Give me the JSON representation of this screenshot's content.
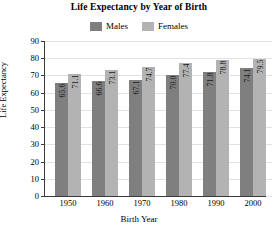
{
  "chart_data": {
    "type": "bar",
    "title": "Life Expectancy by Year of Birth",
    "xlabel": "Birth Year",
    "ylabel": "Life Expectancy",
    "categories": [
      "1950",
      "1960",
      "1970",
      "1980",
      "1990",
      "2000"
    ],
    "series": [
      {
        "name": "Males",
        "color": "#7f7f7f",
        "values": [
          65.6,
          66.6,
          67.1,
          70.0,
          71.8,
          74.1
        ]
      },
      {
        "name": "Females",
        "color": "#b3b3b3",
        "values": [
          71.1,
          73.1,
          74.7,
          77.4,
          78.8,
          79.5
        ]
      }
    ],
    "value_labels": [
      [
        "65.6",
        "71.1"
      ],
      [
        "66.6",
        "73.1"
      ],
      [
        "67.1",
        "74.7"
      ],
      [
        "70.0",
        "77.4"
      ],
      [
        "71.8",
        "78.8"
      ],
      [
        "74.1",
        "79.5"
      ]
    ],
    "ylim": [
      0,
      90
    ],
    "yticks": [
      "0",
      "10",
      "20",
      "30",
      "40",
      "50",
      "60",
      "70",
      "80",
      "90"
    ],
    "grid": true,
    "legend_position": "top"
  }
}
